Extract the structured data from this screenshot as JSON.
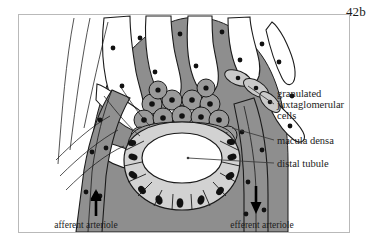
{
  "plate": {
    "number": "42b"
  },
  "figure": {
    "frame_color": "#b9b9b9",
    "background": "#ffffff"
  },
  "colors": {
    "glomerulus_fill": "#8e8e8e",
    "capillary_lumen": "#ffffff",
    "endothelial_fill": "#6f6f6f",
    "mesangial_fill": "#9a9a9a",
    "macula_densa_fill": "#9d9d9d",
    "distal_tubule_cell_fill": "#d2d2d2",
    "tubule_lumen": "#ffffff",
    "arteriole_fill": "#909090",
    "jg_cell_fill": "#c9c9c9",
    "nucleus": "#111111",
    "outline": "#1b1b1b",
    "leader_line": "#3a3a3a",
    "arrow": "#000000"
  },
  "labels": [
    {
      "id": "granulated-jg-cells",
      "lines": [
        "granulated",
        "juxtaglomerular",
        "cells"
      ],
      "x": 277,
      "y": 97,
      "leader": {
        "x1": 274,
        "y1": 104,
        "x2": 248,
        "y2": 86
      }
    },
    {
      "id": "macula-densa",
      "lines": [
        "macula densa"
      ],
      "x": 277,
      "y": 143,
      "leader": {
        "x1": 274,
        "y1": 140,
        "x2": 232,
        "y2": 127
      }
    },
    {
      "id": "distal-tubule",
      "lines": [
        "distal tubule"
      ],
      "x": 277,
      "y": 166,
      "leader": {
        "x1": 274,
        "y1": 163,
        "x2": 190,
        "y2": 158
      }
    }
  ],
  "bottom_labels": [
    {
      "id": "afferent-arteriole",
      "text": "afferent arteriole",
      "x": 86,
      "y": 228
    },
    {
      "id": "efferent-arteriole",
      "text": "efferent arteriole",
      "x": 262,
      "y": 228
    }
  ],
  "flow_arrows": [
    {
      "id": "afferent-flow-arrow",
      "direction": "up",
      "x": 96,
      "y": 205
    },
    {
      "id": "efferent-flow-arrow",
      "direction": "down",
      "x": 248,
      "y": 200
    }
  ],
  "structures": {
    "glomerular_capillary_loops": 7,
    "macula_densa_cells": 14,
    "distal_tubule_cells": 16,
    "mesangial_cells": 17
  }
}
